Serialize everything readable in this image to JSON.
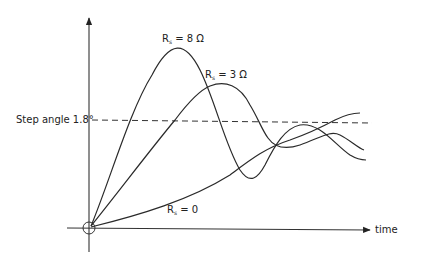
{
  "diagram": {
    "type": "step-response",
    "x_axis": {
      "label": "time"
    },
    "reference_line": {
      "label": "Step angle 1.8°",
      "value": "1.8°"
    },
    "curves": [
      {
        "id": "rs-8",
        "label_main": "R",
        "label_sub": "s",
        "label_rest": " = 8 Ω"
      },
      {
        "id": "rs-3",
        "label_main": "R",
        "label_sub": "s",
        "label_rest": " = 3 Ω"
      },
      {
        "id": "rs-0",
        "label_main": "R",
        "label_sub": "s",
        "label_rest": " = 0"
      }
    ]
  }
}
